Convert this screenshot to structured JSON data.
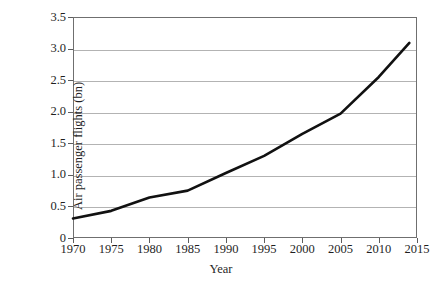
{
  "chart_data": {
    "type": "line",
    "title": "",
    "xlabel": "Year",
    "ylabel": "Air passenger flights (bn)",
    "xlim": [
      1970,
      2015
    ],
    "ylim": [
      0,
      3.5
    ],
    "grid": "horizontal",
    "legend": "none",
    "line_color": "#111111",
    "grid_color": "#b3b3b3",
    "frame_color": "#6f6f6f",
    "x_ticks": [
      "1970",
      "1975",
      "1980",
      "1985",
      "1990",
      "1995",
      "2000",
      "2005",
      "2010",
      "2015"
    ],
    "x_tick_values": [
      1970,
      1975,
      1980,
      1985,
      1990,
      1995,
      2000,
      2005,
      2010,
      2015
    ],
    "y_ticks": [
      "0",
      "0.5",
      "1.0",
      "1.5",
      "2.0",
      "2.5",
      "3.0",
      "3.5"
    ],
    "y_tick_values": [
      0,
      0.5,
      1.0,
      1.5,
      2.0,
      2.5,
      3.0,
      3.5
    ],
    "series": [
      {
        "name": "Air passenger flights",
        "x": [
          1970,
          1975,
          1980,
          1985,
          1990,
          1995,
          2000,
          2005,
          2010,
          2014
        ],
        "values": [
          0.31,
          0.43,
          0.64,
          0.75,
          1.03,
          1.3,
          1.65,
          1.97,
          2.55,
          3.09
        ]
      }
    ]
  }
}
